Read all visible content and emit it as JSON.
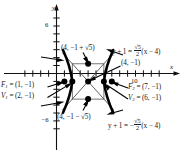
{
  "figure": {
    "type": "hyperbola-graph",
    "axes": {
      "x_axis_label": "x",
      "y_axis_label": "y",
      "x_ticks_labeled": [
        "10"
      ],
      "y_ticks_labeled": [
        "6",
        "-6"
      ],
      "x_range": [
        -4,
        13
      ],
      "y_range": [
        -8,
        8
      ],
      "grid": false
    },
    "labels": {
      "covertex_top": "(4, −1 + √5)",
      "covertex_bottom": "(4, −1 − √5)",
      "center": "(4, −1)",
      "focus1": "F₁ = (1, −1)",
      "focus1_name": "F",
      "focus1_sub": "1",
      "focus1_value": " = (1, −1)",
      "vertex1_name": "V",
      "vertex1_sub": "1",
      "vertex1_value": " = (2, −1)",
      "focus2_name": "F",
      "focus2_sub": "2",
      "focus2_value": " = (7, −1)",
      "vertex2_name": "V",
      "vertex2_sub": "2",
      "vertex2_value": " = (6, −1)",
      "asymptote_pos_lhs": "y + 1 = ",
      "asymptote_pos_num": "√5",
      "asymptote_pos_den": "2",
      "asymptote_pos_rhs": "(x − 4)",
      "asymptote_neg_lhs": "y + 1 = −",
      "asymptote_neg_num": "√5",
      "asymptote_neg_den": "2",
      "asymptote_neg_rhs": "(x − 4)",
      "center_label": "(4, −1)",
      "tick_10": "10",
      "tick_6": "6",
      "tick_neg6": "−6"
    },
    "points": [
      {
        "name": "focus-1",
        "coords": "(1, −1)"
      },
      {
        "name": "vertex-1",
        "coords": "(2, −1)"
      },
      {
        "name": "center",
        "coords": "(4, −1)"
      },
      {
        "name": "vertex-2",
        "coords": "(6, −1)"
      },
      {
        "name": "focus-2",
        "coords": "(7, −1)"
      },
      {
        "name": "covertex-top",
        "coords": "(4, −1 + √5)"
      },
      {
        "name": "covertex-bottom",
        "coords": "(4, −1 − √5)"
      }
    ],
    "colors": {
      "ink": "#1a1a1a",
      "curve": "#000000",
      "background": "#ffffff"
    }
  }
}
